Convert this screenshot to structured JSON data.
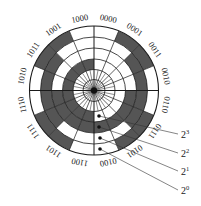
{
  "diagram": {
    "center": [
      94,
      90.5
    ],
    "hub_radius": 21,
    "ring_radii": [
      21,
      31.5,
      42.5,
      53.5,
      64.5
    ],
    "ring_bits": [
      "2^3",
      "2^2",
      "2^1",
      "2^0"
    ],
    "sector_codes": [
      "0000",
      "0001",
      "0011",
      "0010",
      "0110",
      "0111",
      "0101",
      "0100",
      "1100",
      "1101",
      "1111",
      "1110",
      "1010",
      "1011",
      "1001",
      "1000"
    ],
    "label_codes_as_printed": [
      "0000",
      "0001",
      "0011",
      "0010",
      "0110",
      "1110",
      "1010",
      "0010",
      "0011",
      "1011",
      "1111",
      "1110",
      "1010",
      "1011",
      "1001",
      "1000"
    ],
    "colors": {
      "dark": "#555555",
      "light": "#ffffff",
      "line": "#1a1a1a"
    },
    "legend": [
      {
        "base": "2",
        "exp": "3",
        "dot": [
          99,
          116
        ],
        "line_end": [
          178,
          134
        ],
        "label_pos": [
          181,
          138
        ]
      },
      {
        "base": "2",
        "exp": "2",
        "dot": [
          99,
          127
        ],
        "line_end": [
          178,
          153
        ],
        "label_pos": [
          181,
          157
        ]
      },
      {
        "base": "2",
        "exp": "1",
        "dot": [
          100,
          138
        ],
        "line_end": [
          178,
          171
        ],
        "label_pos": [
          181,
          175
        ]
      },
      {
        "base": "2",
        "exp": "0",
        "dot": [
          100,
          149
        ],
        "line_end": [
          178,
          190
        ],
        "label_pos": [
          181,
          194
        ]
      }
    ]
  }
}
